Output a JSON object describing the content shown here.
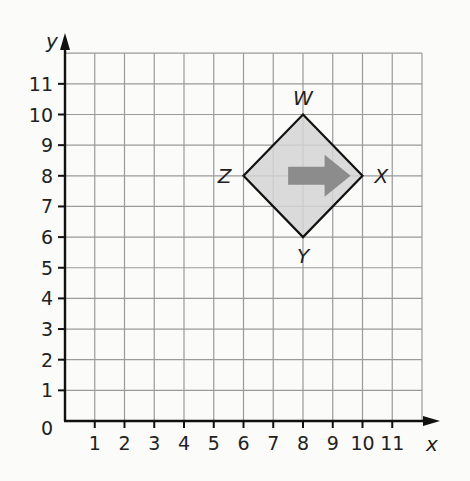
{
  "chart_data": {
    "type": "scatter",
    "title": "",
    "xlabel": "x",
    "ylabel": "y",
    "xlim": [
      0,
      12
    ],
    "ylim": [
      0,
      12
    ],
    "grid": true,
    "x_ticks": [
      "1",
      "2",
      "3",
      "4",
      "5",
      "6",
      "7",
      "8",
      "9",
      "10",
      "11"
    ],
    "y_ticks": [
      "1",
      "2",
      "3",
      "4",
      "5",
      "6",
      "7",
      "8",
      "9",
      "10",
      "11"
    ],
    "origin_label": "0",
    "shape": {
      "name": "WXYZ",
      "fill": "#d3d3d3",
      "stroke": "#111111",
      "vertices": [
        {
          "label": "W",
          "x": 8,
          "y": 10
        },
        {
          "label": "X",
          "x": 10,
          "y": 8
        },
        {
          "label": "Y",
          "x": 8,
          "y": 6
        },
        {
          "label": "Z",
          "x": 6,
          "y": 8
        }
      ]
    },
    "arrow": {
      "from": [
        7.5,
        8
      ],
      "to": [
        9.6,
        8
      ],
      "color": "#8c8c8c",
      "direction": "right"
    }
  },
  "colors": {
    "grid": "#9a9a9a",
    "axis": "#111111",
    "background": "#fbfbfa"
  }
}
